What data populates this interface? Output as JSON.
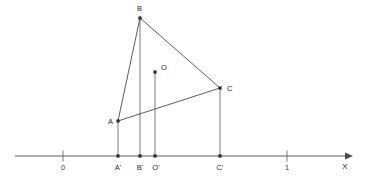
{
  "figure": {
    "title": "",
    "type": "geometric-construction",
    "axis": {
      "name": "x-axis",
      "label": "X",
      "orientation": "horizontal",
      "line_y": 156,
      "start_x": 15,
      "end_x": 352,
      "arrow": "right",
      "ticks": [
        {
          "label": "0",
          "x": 63
        },
        {
          "label": "1",
          "x": 287
        }
      ]
    },
    "points": [
      {
        "name": "A",
        "label": "A",
        "x": 118,
        "y": 121,
        "label_x": 108,
        "label_y": 124,
        "label_anchor": "start"
      },
      {
        "name": "B",
        "label": "B",
        "x": 140,
        "y": 18,
        "label_x": 137,
        "label_y": 10,
        "label_anchor": "start"
      },
      {
        "name": "C",
        "label": "C",
        "x": 220,
        "y": 88,
        "label_x": 227,
        "label_y": 91,
        "label_anchor": "start"
      },
      {
        "name": "O",
        "label": "O",
        "x": 155,
        "y": 72,
        "label_x": 161,
        "label_y": 69,
        "label_anchor": "start"
      }
    ],
    "projections": [
      {
        "name": "A-prime",
        "label": "A'",
        "x": 118,
        "y": 156,
        "label_x": 114,
        "label_y": 168
      },
      {
        "name": "B-prime",
        "label": "B'",
        "x": 140,
        "y": 156,
        "label_x": 136,
        "label_y": 168
      },
      {
        "name": "O-prime",
        "label": "O'",
        "x": 155,
        "y": 156,
        "label_x": 151,
        "label_y": 168
      },
      {
        "name": "C-prime",
        "label": "C'",
        "x": 220,
        "y": 156,
        "label_x": 216,
        "label_y": 168
      }
    ],
    "segments": [
      {
        "name": "segment-AB",
        "x1": 118,
        "y1": 121,
        "x2": 140,
        "y2": 18
      },
      {
        "name": "segment-BC",
        "x1": 140,
        "y1": 18,
        "x2": 220,
        "y2": 88
      },
      {
        "name": "segment-AC",
        "x1": 118,
        "y1": 121,
        "x2": 220,
        "y2": 88
      }
    ],
    "drop_lines": [
      {
        "name": "drop-A-to-Aprime",
        "x1": 118,
        "y1": 121,
        "x2": 118,
        "y2": 156
      },
      {
        "name": "drop-B-to-Bprime",
        "x1": 140,
        "y1": 18,
        "x2": 140,
        "y2": 156
      },
      {
        "name": "drop-O-to-Oprime",
        "x1": 155,
        "y1": 72,
        "x2": 155,
        "y2": 156
      },
      {
        "name": "drop-C-to-Cprime",
        "x1": 220,
        "y1": 88,
        "x2": 220,
        "y2": 156
      }
    ],
    "colors": {
      "stroke": "#4a4a4a",
      "drop_stroke": "#6b6b6b",
      "dot_fill": "#2b2b2b",
      "text": "#2b2b2b",
      "background": "#ffffff"
    }
  }
}
